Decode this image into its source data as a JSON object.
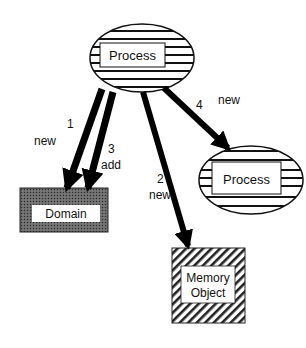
{
  "diagram": {
    "nodes": {
      "process_top": {
        "label": "Process"
      },
      "process_right": {
        "label": "Process"
      },
      "domain": {
        "label": "Domain"
      },
      "memory_object": {
        "label_line1": "Memory",
        "label_line2": "Object"
      }
    },
    "edges": [
      {
        "id": "e1",
        "number": "1",
        "label": "new",
        "from": "process_top",
        "to": "domain"
      },
      {
        "id": "e3",
        "number": "3",
        "label": "add",
        "from": "process_top",
        "to": "domain"
      },
      {
        "id": "e2",
        "number": "2",
        "label": "new",
        "from": "process_top",
        "to": "memory_object"
      },
      {
        "id": "e4",
        "number": "4",
        "label": "new",
        "from": "process_top",
        "to": "process_right"
      }
    ]
  }
}
